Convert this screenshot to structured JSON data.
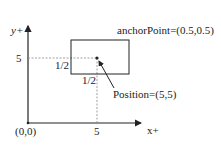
{
  "diagram": {
    "axes": {
      "x_label": "x+",
      "y_label": "y+",
      "origin_label": "(0,0)",
      "x_tick_label": "5",
      "y_tick_label": "5"
    },
    "node": {
      "half_width_label": "1/2",
      "half_height_label": "1/2",
      "anchor_label": "anchorPoint=(0.5,0.5)",
      "position_label": "Position=(5,5)"
    },
    "colors": {
      "line": "#222222",
      "dashed": "#888888"
    }
  }
}
